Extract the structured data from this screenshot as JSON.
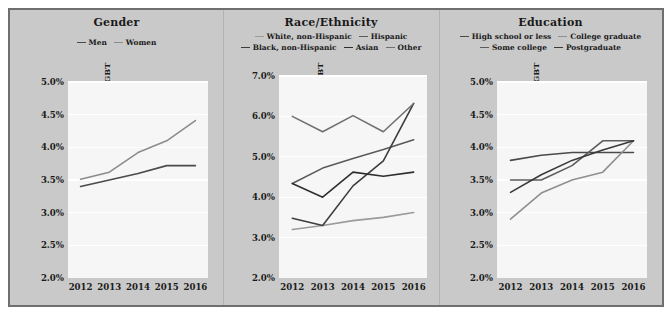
{
  "figure": {
    "background_color": "#c9c9c9",
    "border_color": "#6f6f6f",
    "plot_background_color": "#f6f6f6",
    "gridline_color": "#ffffff"
  },
  "chart_data": [
    {
      "type": "line",
      "title": "Gender",
      "xlabel": "",
      "ylabel": "Percentage of Adults Identifying as LGBT",
      "x": [
        "2012",
        "2013",
        "2014",
        "2015",
        "2016"
      ],
      "ylim": [
        2.0,
        5.0
      ],
      "yticks": [
        "2.0%",
        "2.5%",
        "3.0%",
        "3.5%",
        "4.0%",
        "4.5%",
        "5.0%"
      ],
      "ytick_values": [
        2.0,
        2.5,
        3.0,
        3.5,
        4.0,
        4.5,
        5.0
      ],
      "grid": true,
      "legend_position": "top-left",
      "series": [
        {
          "name": "Men",
          "color": "#4a4a4a",
          "values": [
            3.4,
            3.5,
            3.6,
            3.72,
            3.72
          ]
        },
        {
          "name": "Women",
          "color": "#8c8c8c",
          "values": [
            3.51,
            3.62,
            3.92,
            4.1,
            4.41
          ]
        }
      ]
    },
    {
      "type": "line",
      "title": "Race/Ethnicity",
      "xlabel": "",
      "ylabel": "Percentage of Adults Identifying as LGBT",
      "x": [
        "2012",
        "2013",
        "2014",
        "2015",
        "2016"
      ],
      "ylim": [
        2.0,
        7.0
      ],
      "yticks": [
        "2.0%",
        "3.0%",
        "4.0%",
        "5.0%",
        "6.0%",
        "7.0%"
      ],
      "ytick_values": [
        2.0,
        3.0,
        4.0,
        5.0,
        6.0,
        7.0
      ],
      "grid": true,
      "legend_position": "top-center",
      "series": [
        {
          "name": "White, non-Hispanic",
          "color": "#9a9a9a",
          "values": [
            3.2,
            3.3,
            3.42,
            3.5,
            3.62
          ]
        },
        {
          "name": "Hispanic",
          "color": "#5a5a5a",
          "values": [
            4.34,
            4.72,
            4.96,
            5.18,
            5.42
          ]
        },
        {
          "name": "Black, non-Hispanic",
          "color": "#3d3d3d",
          "values": [
            3.48,
            3.3,
            4.28,
            4.9,
            6.32
          ]
        },
        {
          "name": "Asian",
          "color": "#2f2f2f",
          "values": [
            4.34,
            4.0,
            4.62,
            4.52,
            4.62
          ]
        },
        {
          "name": "Other",
          "color": "#707070",
          "values": [
            6.0,
            5.62,
            6.02,
            5.62,
            6.32
          ]
        }
      ]
    },
    {
      "type": "line",
      "title": "Education",
      "xlabel": "",
      "ylabel": "Percentage of Adults Identifying as LGBT",
      "x": [
        "2012",
        "2013",
        "2014",
        "2015",
        "2016"
      ],
      "ylim": [
        2.0,
        5.0
      ],
      "yticks": [
        "2.0%",
        "2.5%",
        "3.0%",
        "3.5%",
        "4.0%",
        "4.5%",
        "5.0%"
      ],
      "ytick_values": [
        2.0,
        2.5,
        3.0,
        3.5,
        4.0,
        4.5,
        5.0
      ],
      "grid": true,
      "legend_position": "top-center",
      "series": [
        {
          "name": "High school or less",
          "color": "#4a4a4a",
          "values": [
            3.8,
            3.88,
            3.92,
            3.92,
            3.92
          ]
        },
        {
          "name": "College graduate",
          "color": "#8f8f8f",
          "values": [
            2.9,
            3.3,
            3.5,
            3.62,
            4.1
          ]
        },
        {
          "name": "Some college",
          "color": "#5c5c5c",
          "values": [
            3.5,
            3.5,
            3.72,
            4.1,
            4.1
          ]
        },
        {
          "name": "Postgraduate",
          "color": "#3a3a3a",
          "values": [
            3.31,
            3.58,
            3.8,
            3.96,
            4.1
          ]
        }
      ]
    }
  ]
}
